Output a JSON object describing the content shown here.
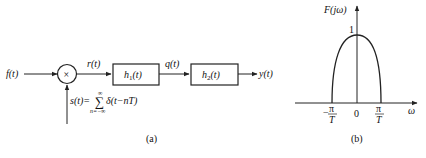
{
  "figure_a": {
    "caption": "(a)",
    "input_label": "f(t)",
    "multiplier_symbol": "×",
    "product_label": "r(t)",
    "block1_label_main": "h",
    "block1_label_sub": "1",
    "block1_label_arg": "(t)",
    "intermediate_label": "q(t)",
    "block2_label_main": "h",
    "block2_label_sub": "2",
    "block2_label_arg": "(t)",
    "output_label": "y(t)",
    "sampling_label_left": "s(t)=",
    "sampling_sum_symbol": "∑",
    "sampling_sum_upper": "∞",
    "sampling_sum_lower": "n=−∞",
    "sampling_label_right": "δ(t−nT)"
  },
  "figure_b": {
    "caption": "(b)",
    "y_axis_label": "F(jω)",
    "x_axis_label": "ω",
    "peak_value": "1",
    "origin_label": "0",
    "left_tick_num": "π",
    "left_tick_den": "T",
    "left_tick_sign": "−",
    "right_tick_num": "π",
    "right_tick_den": "T"
  },
  "colors": {
    "stroke": "#222222",
    "background": "#ffffff"
  }
}
